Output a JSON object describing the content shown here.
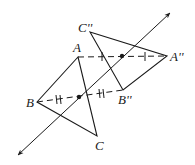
{
  "diagram": {
    "labels": {
      "A": "A",
      "B": "B",
      "C": "C",
      "A2": "A''",
      "B2": "B''",
      "C2": "C''"
    },
    "points": {
      "A": [
        78,
        57
      ],
      "B": [
        37,
        102
      ],
      "C": [
        97,
        136
      ],
      "A2": [
        167,
        56
      ],
      "B2": [
        123,
        90
      ],
      "C2": [
        90,
        32
      ]
    },
    "midpoints": [
      [
        122,
        56
      ],
      [
        79,
        97
      ]
    ],
    "axis": {
      "from": [
        18,
        155
      ],
      "to": [
        170,
        13
      ]
    },
    "colors": {
      "stroke": "#1a1a1a"
    }
  }
}
